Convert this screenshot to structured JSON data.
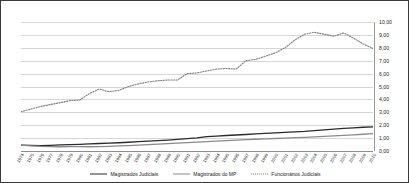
{
  "chart_data": {
    "type": "line",
    "title": "",
    "subtitle": "",
    "xlabel": "",
    "ylabel": "",
    "xlim": [
      1974,
      2010
    ],
    "ylim": [
      0.0,
      10.0
    ],
    "grid": true,
    "legend_position": "bottom",
    "y_axis_position": "right",
    "x_tick_rotation": -60,
    "yticks": [
      "0,00",
      "1,00",
      "2,00",
      "3,00",
      "4,00",
      "5,00",
      "6,00",
      "7,00",
      "8,00",
      "9,00",
      "10,00"
    ],
    "ytick_values": [
      0,
      1,
      2,
      3,
      4,
      5,
      6,
      7,
      8,
      9,
      10
    ],
    "categories": [
      "1974",
      "1975",
      "1976",
      "1977",
      "1978",
      "1979",
      "1980",
      "1981",
      "1982",
      "1983",
      "1984",
      "1985",
      "1986",
      "1987",
      "1988",
      "1989",
      "1990",
      "1991",
      "1992",
      "1993",
      "1994",
      "1995",
      "1996",
      "1997",
      "1998",
      "1999",
      "2000",
      "2001",
      "2002",
      "2003",
      "2004",
      "2005",
      "2006",
      "2007",
      "2008",
      "2009",
      "2010"
    ],
    "series": [
      {
        "name": "Magistrados Judiciais",
        "style": "solid",
        "color": "#2b2b2b",
        "values": [
          0.46,
          0.44,
          0.42,
          0.44,
          0.47,
          0.5,
          0.52,
          0.55,
          0.58,
          0.61,
          0.64,
          0.68,
          0.72,
          0.76,
          0.8,
          0.85,
          0.9,
          0.96,
          1.02,
          1.12,
          1.16,
          1.2,
          1.24,
          1.28,
          1.32,
          1.36,
          1.4,
          1.44,
          1.48,
          1.52,
          1.58,
          1.64,
          1.7,
          1.75,
          1.8,
          1.84,
          1.87
        ]
      },
      {
        "name": "Magistrados do MP",
        "style": "solid",
        "color": "#8a8a8a",
        "values": [
          0.45,
          0.4,
          0.36,
          0.34,
          0.33,
          0.34,
          0.34,
          0.33,
          0.34,
          0.36,
          0.39,
          0.42,
          0.45,
          0.49,
          0.53,
          0.57,
          0.61,
          0.65,
          0.69,
          0.73,
          0.77,
          0.81,
          0.85,
          0.88,
          0.91,
          0.94,
          0.97,
          1.0,
          1.03,
          1.06,
          1.09,
          1.13,
          1.17,
          1.21,
          1.25,
          1.3,
          1.35
        ]
      },
      {
        "name": "Funcionários Judiciais",
        "style": "dotted",
        "color": "#7d7d7d",
        "values": [
          3.05,
          3.25,
          3.45,
          3.6,
          3.75,
          3.9,
          3.95,
          4.45,
          4.8,
          4.6,
          4.7,
          5.0,
          5.2,
          5.35,
          5.45,
          5.5,
          5.5,
          6.0,
          6.05,
          6.2,
          6.35,
          6.4,
          6.35,
          7.0,
          7.1,
          7.35,
          7.6,
          8.0,
          8.6,
          9.05,
          9.2,
          9.05,
          8.9,
          9.15,
          8.75,
          8.3,
          7.95
        ]
      }
    ]
  },
  "legend": {
    "items": [
      {
        "label": "Magistrados Judiciais"
      },
      {
        "label": "Magistrados do MP"
      },
      {
        "label": "Funcionários Judiciais"
      }
    ]
  }
}
